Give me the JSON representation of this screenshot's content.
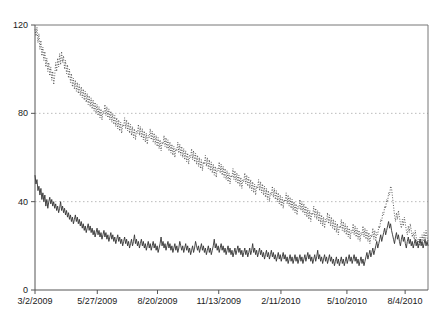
{
  "chart_data": {
    "type": "line",
    "title": "",
    "subtitle": "",
    "xlabel": "",
    "ylabel": "",
    "ylim": [
      0,
      120
    ],
    "yticks": [
      0,
      40,
      80,
      120
    ],
    "ytick_labels": [
      "0",
      "40",
      "80",
      "120"
    ],
    "gridlines": {
      "y": [
        40,
        80
      ],
      "style": "dotted",
      "color": "#bbbbbb"
    },
    "grid": true,
    "legend": "none",
    "xlim": [
      "3/2/2009",
      "9/30/2010"
    ],
    "xticks": [
      "3/2/2009",
      "5/27/2009",
      "8/20/2009",
      "11/13/2009",
      "2/11/2010",
      "5/10/2010",
      "8/4/2010"
    ],
    "xtick_positions": [
      0,
      0.1585,
      0.3117,
      0.4675,
      0.6258,
      0.7937,
      0.9418
    ],
    "axis_color": "#666666",
    "series": [
      {
        "name": "upper-series",
        "style": "dotted",
        "color": "#4d4d4d",
        "values": [
          118,
          115,
          119,
          112,
          116,
          109,
          113,
          106,
          110,
          104,
          108,
          101,
          105,
          99,
          103,
          97,
          101,
          95,
          99,
          93,
          97,
          103,
          99,
          105,
          101,
          107,
          102,
          108,
          103,
          106,
          100,
          104,
          98,
          102,
          96,
          100,
          94,
          98,
          92,
          96,
          91,
          95,
          90,
          94,
          89,
          93,
          88,
          92,
          87,
          91,
          86,
          90,
          85,
          89,
          84,
          88,
          83,
          87,
          82,
          86,
          81,
          85,
          80,
          84,
          79,
          83,
          78,
          82,
          77,
          81,
          80,
          84,
          79,
          83,
          78,
          82,
          77,
          81,
          76,
          80,
          75,
          79,
          74,
          78,
          73,
          77,
          72,
          76,
          71,
          75,
          74,
          78,
          73,
          77,
          72,
          76,
          71,
          75,
          70,
          74,
          69,
          73,
          68,
          72,
          71,
          75,
          70,
          74,
          69,
          73,
          68,
          72,
          67,
          71,
          66,
          70,
          69,
          73,
          68,
          72,
          67,
          71,
          66,
          70,
          65,
          69,
          64,
          68,
          63,
          67,
          66,
          70,
          65,
          69,
          64,
          68,
          63,
          67,
          62,
          66,
          61,
          65,
          60,
          64,
          63,
          67,
          62,
          66,
          61,
          65,
          60,
          64,
          59,
          63,
          58,
          62,
          57,
          61,
          60,
          64,
          59,
          63,
          58,
          62,
          57,
          61,
          56,
          60,
          55,
          59,
          54,
          58,
          57,
          61,
          56,
          60,
          55,
          59,
          54,
          58,
          53,
          57,
          52,
          56,
          51,
          55,
          54,
          58,
          53,
          57,
          52,
          56,
          51,
          55,
          50,
          54,
          49,
          53,
          48,
          52,
          51,
          55,
          50,
          54,
          49,
          53,
          48,
          52,
          47,
          51,
          46,
          50,
          49,
          53,
          48,
          52,
          47,
          51,
          46,
          50,
          45,
          49,
          44,
          48,
          43,
          47,
          46,
          50,
          45,
          49,
          44,
          48,
          43,
          47,
          42,
          46,
          41,
          45,
          40,
          44,
          43,
          47,
          42,
          46,
          41,
          45,
          40,
          44,
          39,
          43,
          38,
          42,
          37,
          41,
          40,
          44,
          39,
          43,
          38,
          42,
          37,
          41,
          36,
          40,
          35,
          39,
          34,
          38,
          37,
          41,
          36,
          40,
          35,
          39,
          34,
          38,
          33,
          37,
          32,
          36,
          31,
          35,
          34,
          38,
          33,
          37,
          32,
          36,
          31,
          35,
          30,
          34,
          29,
          33,
          28,
          32,
          31,
          35,
          30,
          34,
          29,
          33,
          28,
          32,
          27,
          31,
          26,
          30,
          25,
          29,
          28,
          32,
          27,
          31,
          26,
          30,
          25,
          29,
          24,
          28,
          23,
          27,
          26,
          30,
          25,
          29,
          24,
          28,
          23,
          27,
          22,
          26,
          25,
          29,
          24,
          28,
          23,
          27,
          22,
          26,
          21,
          25,
          24,
          28,
          23,
          27,
          22,
          26,
          25,
          29,
          28,
          32,
          31,
          35,
          34,
          38,
          37,
          41,
          40,
          44,
          43,
          47,
          46,
          42,
          38,
          34,
          31,
          35,
          32,
          36,
          33,
          30,
          28,
          32,
          29,
          33,
          30,
          27,
          25,
          29,
          26,
          30,
          27,
          24,
          26,
          23,
          27,
          24,
          21,
          23,
          20,
          24,
          21,
          25,
          22,
          26,
          23,
          27,
          24,
          22
        ]
      },
      {
        "name": "lower-series",
        "style": "solid",
        "color": "#333333",
        "values": [
          52,
          48,
          50,
          45,
          47,
          43,
          46,
          41,
          44,
          40,
          43,
          38,
          41,
          37,
          40,
          42,
          39,
          41,
          38,
          40,
          37,
          39,
          36,
          38,
          35,
          37,
          40,
          36,
          38,
          35,
          37,
          34,
          36,
          33,
          35,
          32,
          34,
          31,
          33,
          30,
          32,
          34,
          31,
          33,
          30,
          32,
          29,
          31,
          28,
          30,
          27,
          29,
          26,
          28,
          30,
          27,
          29,
          26,
          28,
          25,
          27,
          24,
          26,
          28,
          25,
          27,
          24,
          26,
          23,
          25,
          27,
          24,
          26,
          23,
          25,
          22,
          24,
          26,
          23,
          25,
          22,
          24,
          21,
          23,
          25,
          22,
          24,
          21,
          23,
          20,
          22,
          24,
          21,
          23,
          20,
          22,
          19,
          21,
          23,
          20,
          22,
          25,
          21,
          23,
          20,
          22,
          19,
          21,
          23,
          20,
          22,
          19,
          21,
          18,
          20,
          22,
          19,
          21,
          18,
          20,
          22,
          19,
          21,
          18,
          20,
          17,
          19,
          21,
          24,
          20,
          22,
          19,
          21,
          18,
          20,
          22,
          19,
          21,
          18,
          20,
          17,
          19,
          21,
          18,
          20,
          17,
          19,
          22,
          20,
          18,
          20,
          17,
          19,
          21,
          18,
          20,
          17,
          19,
          16,
          18,
          20,
          17,
          19,
          22,
          20,
          18,
          20,
          17,
          19,
          21,
          18,
          20,
          17,
          19,
          16,
          18,
          20,
          17,
          19,
          16,
          18,
          20,
          23,
          19,
          21,
          18,
          20,
          17,
          19,
          21,
          18,
          20,
          17,
          19,
          16,
          18,
          20,
          17,
          19,
          16,
          18,
          15,
          17,
          19,
          16,
          18,
          20,
          17,
          19,
          16,
          18,
          15,
          17,
          19,
          16,
          18,
          15,
          17,
          19,
          16,
          18,
          21,
          17,
          19,
          16,
          18,
          15,
          17,
          19,
          16,
          18,
          15,
          17,
          14,
          16,
          18,
          15,
          17,
          14,
          16,
          18,
          15,
          17,
          14,
          16,
          13,
          15,
          17,
          14,
          16,
          13,
          15,
          17,
          14,
          16,
          13,
          15,
          12,
          14,
          16,
          13,
          15,
          12,
          14,
          16,
          13,
          15,
          12,
          14,
          16,
          13,
          15,
          12,
          14,
          16,
          13,
          15,
          17,
          14,
          16,
          13,
          15,
          12,
          14,
          16,
          13,
          15,
          18,
          14,
          16,
          13,
          15,
          12,
          14,
          16,
          13,
          15,
          12,
          14,
          16,
          13,
          15,
          12,
          14,
          11,
          13,
          15,
          12,
          14,
          11,
          13,
          15,
          12,
          14,
          11,
          13,
          15,
          12,
          14,
          16,
          13,
          15,
          12,
          14,
          16,
          13,
          15,
          12,
          14,
          11,
          13,
          15,
          12,
          14,
          11,
          13,
          15,
          17,
          14,
          16,
          18,
          15,
          17,
          19,
          16,
          18,
          20,
          22,
          19,
          21,
          23,
          25,
          22,
          24,
          26,
          28,
          25,
          27,
          29,
          31,
          28,
          30,
          27,
          25,
          23,
          21,
          24,
          26,
          23,
          25,
          22,
          20,
          23,
          25,
          22,
          24,
          21,
          19,
          22,
          24,
          21,
          23,
          20,
          22,
          19,
          21,
          23,
          20,
          22,
          19,
          21,
          23,
          20,
          22,
          19,
          21,
          23,
          20,
          22,
          20
        ]
      }
    ]
  },
  "axes": {
    "y_tick_labels": [
      "120",
      "80",
      "40",
      "0"
    ],
    "x_tick_labels": [
      "3/2/2009",
      "5/27/2009",
      "8/20/2009",
      "11/13/2009",
      "2/11/2010",
      "5/10/2010",
      "8/4/2010"
    ]
  }
}
